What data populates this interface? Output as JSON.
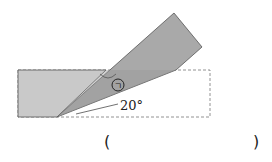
{
  "diagram": {
    "angle_label": "20°",
    "marked_angle_symbol": "ㄱ",
    "answer_open": "(",
    "answer_close": ")",
    "colors": {
      "paper_light": "#c9c9c9",
      "paper_dark": "#a9a9a9",
      "stroke": "#555555",
      "dashed": "#777777"
    }
  }
}
